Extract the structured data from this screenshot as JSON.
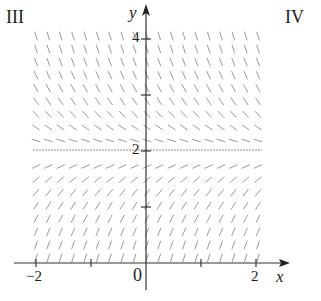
{
  "panel_labels": {
    "left": "III",
    "right": "IV"
  },
  "axes": {
    "x_name": "x",
    "y_name": "y",
    "origin_label": "0",
    "x_ticks": [
      {
        "value": -2,
        "label": "−2"
      },
      {
        "value": -1,
        "label": ""
      },
      {
        "value": 1,
        "label": ""
      },
      {
        "value": 2,
        "label": "2"
      }
    ],
    "y_ticks": [
      {
        "value": 1,
        "label": ""
      },
      {
        "value": 2,
        "label": "2"
      },
      {
        "value": 3,
        "label": ""
      },
      {
        "value": 4,
        "label": "4"
      }
    ],
    "x_range": [
      -2.05,
      2.1
    ],
    "y_range": [
      0,
      4.1
    ]
  },
  "slope_field": {
    "description": "Autonomous slope field; slopes positive below y=2, zero at y=2 (equilibrium line), negative above y=2, steeper farther from y=2",
    "equilibrium_y": 2,
    "columns": 19,
    "rows": 18,
    "color": "#9a9a9a"
  },
  "colors": {
    "axis": "#333333",
    "segment": "#9a9a9a",
    "equilibrium": "#8a8a8a"
  }
}
